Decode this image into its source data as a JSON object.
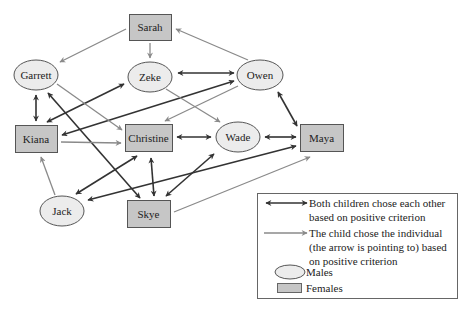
{
  "diagram": {
    "type": "sociogram",
    "colors": {
      "male_fill": "#ececec",
      "female_fill": "#c6c6c6",
      "node_stroke": "#555555",
      "mutual_edge": "#333333",
      "oneway_edge": "#8a8a8a"
    },
    "nodes": [
      {
        "id": "sarah",
        "label": "Sarah",
        "gender": "female",
        "shape": "rect",
        "x": 129,
        "y": 14,
        "w": 42,
        "h": 26
      },
      {
        "id": "garrett",
        "label": "Garrett",
        "gender": "male",
        "shape": "ellipse",
        "cx": 36,
        "cy": 75,
        "rx": 22,
        "ry": 15
      },
      {
        "id": "zeke",
        "label": "Zeke",
        "gender": "male",
        "shape": "ellipse",
        "cx": 150,
        "cy": 77,
        "rx": 22,
        "ry": 15
      },
      {
        "id": "owen",
        "label": "Owen",
        "gender": "male",
        "shape": "ellipse",
        "cx": 260,
        "cy": 75,
        "rx": 23,
        "ry": 15
      },
      {
        "id": "kiana",
        "label": "Kiana",
        "gender": "female",
        "shape": "rect",
        "x": 15,
        "y": 125,
        "w": 42,
        "h": 27
      },
      {
        "id": "christine",
        "label": "Christine",
        "gender": "female",
        "shape": "rect",
        "x": 125,
        "y": 124,
        "w": 47,
        "h": 27
      },
      {
        "id": "wade",
        "label": "Wade",
        "gender": "male",
        "shape": "ellipse",
        "cx": 238,
        "cy": 137,
        "rx": 22,
        "ry": 15
      },
      {
        "id": "maya",
        "label": "Maya",
        "gender": "female",
        "shape": "rect",
        "x": 300,
        "y": 124,
        "w": 43,
        "h": 27
      },
      {
        "id": "jack",
        "label": "Jack",
        "gender": "male",
        "shape": "ellipse",
        "cx": 62,
        "cy": 211,
        "rx": 22,
        "ry": 15
      },
      {
        "id": "skye",
        "label": "Skye",
        "gender": "female",
        "shape": "rect",
        "x": 127,
        "y": 200,
        "w": 43,
        "h": 27
      }
    ],
    "edges": [
      {
        "from": "zeke",
        "to": "owen",
        "type": "mutual",
        "x1": 178,
        "y1": 73,
        "x2": 234,
        "y2": 73
      },
      {
        "from": "garrett",
        "to": "kiana",
        "type": "mutual",
        "x1": 36,
        "y1": 95,
        "x2": 36,
        "y2": 121
      },
      {
        "from": "kiana",
        "to": "zeke",
        "type": "mutual",
        "x1": 47,
        "y1": 122,
        "x2": 124,
        "y2": 84
      },
      {
        "from": "kiana",
        "to": "owen",
        "type": "mutual",
        "x1": 62,
        "y1": 135,
        "x2": 234,
        "y2": 81
      },
      {
        "from": "garrett",
        "to": "skye",
        "type": "mutual",
        "x1": 48,
        "y1": 93,
        "x2": 140,
        "y2": 198
      },
      {
        "from": "christine",
        "to": "wade",
        "type": "mutual",
        "x1": 177,
        "y1": 137,
        "x2": 211,
        "y2": 137
      },
      {
        "from": "wade",
        "to": "maya",
        "type": "mutual",
        "x1": 265,
        "y1": 137,
        "x2": 296,
        "y2": 137
      },
      {
        "from": "owen",
        "to": "maya",
        "type": "mutual",
        "x1": 278,
        "y1": 92,
        "x2": 297,
        "y2": 126
      },
      {
        "from": "christine",
        "to": "jack",
        "type": "mutual",
        "x1": 137,
        "y1": 156,
        "x2": 76,
        "y2": 194
      },
      {
        "from": "christine",
        "to": "skye",
        "type": "mutual",
        "x1": 151,
        "y1": 158,
        "x2": 154,
        "y2": 196
      },
      {
        "from": "wade",
        "to": "skye",
        "type": "mutual",
        "x1": 214,
        "y1": 154,
        "x2": 166,
        "y2": 196
      },
      {
        "from": "jack",
        "to": "maya",
        "type": "mutual",
        "x1": 88,
        "y1": 200,
        "x2": 296,
        "y2": 146
      },
      {
        "from": "sarah",
        "to": "garrett",
        "type": "oneway",
        "x1": 126,
        "y1": 29,
        "x2": 60,
        "y2": 62
      },
      {
        "from": "sarah",
        "to": "zeke",
        "type": "oneway",
        "x1": 150,
        "y1": 43,
        "x2": 150,
        "y2": 58
      },
      {
        "from": "owen",
        "to": "sarah",
        "type": "oneway",
        "x1": 248,
        "y1": 60,
        "x2": 176,
        "y2": 29
      },
      {
        "from": "garrett",
        "to": "christine",
        "type": "oneway",
        "x1": 57,
        "y1": 84,
        "x2": 122,
        "y2": 130
      },
      {
        "from": "zeke",
        "to": "wade",
        "type": "oneway",
        "x1": 166,
        "y1": 89,
        "x2": 220,
        "y2": 122
      },
      {
        "from": "owen",
        "to": "christine",
        "type": "oneway",
        "x1": 238,
        "y1": 86,
        "x2": 165,
        "y2": 121
      },
      {
        "from": "kiana",
        "to": "christine",
        "type": "oneway",
        "x1": 61,
        "y1": 142,
        "x2": 121,
        "y2": 143
      },
      {
        "from": "jack",
        "to": "kiana",
        "type": "oneway",
        "x1": 55,
        "y1": 195,
        "x2": 41,
        "y2": 157
      },
      {
        "from": "skye",
        "to": "maya",
        "type": "oneway",
        "x1": 174,
        "y1": 212,
        "x2": 310,
        "y2": 157
      }
    ]
  },
  "legend": {
    "mutual_line1": "Both children chose each other",
    "mutual_line2": "based on positive criterion",
    "oneway_line1": "The child chose the individual",
    "oneway_line2": "(the arrow is pointing to) based",
    "oneway_line3": "on positive criterion",
    "males_label": "Males",
    "females_label": "Females"
  }
}
